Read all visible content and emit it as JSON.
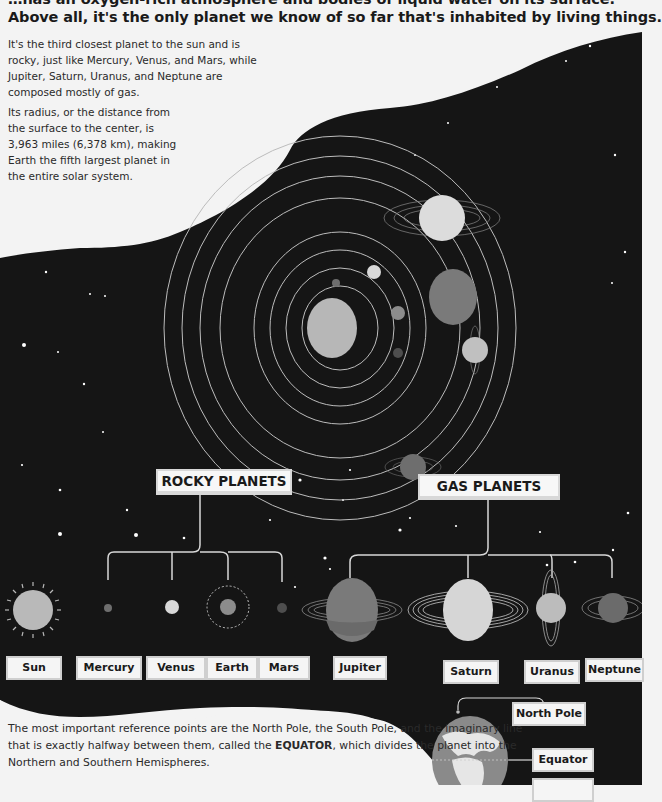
{
  "header": {
    "line1": "…has an oxygen-rich atmosphere and bodies of liquid water on its surface.",
    "line2": "Above all, it's the only planet we know of so far that's inhabited by living things."
  },
  "paragraphs": {
    "p1": "It's the third closest planet to the sun and is rocky, just like Mercury, Venus, and Mars, while Jupiter, Saturn, Uranus, and Neptune are composed mostly of gas.",
    "p2": "Its radius, or the distance from the surface to the center, is 3,963 miles (6,378 km), making Earth the fifth largest planet in the entire solar system.",
    "p3_pre": "The most important reference points are the North Pole, the South Pole, and the imaginary line that is exactly halfway between them, called the ",
    "p3_bold": "EQUATOR",
    "p3_post": ", which divides the planet into the Northern and Southern Hemispheres."
  },
  "categories": {
    "rocky": "ROCKY PLANETS",
    "gas": "GAS PLANETS"
  },
  "bodies": [
    {
      "name": "Sun",
      "type": "star"
    },
    {
      "name": "Mercury",
      "type": "rocky"
    },
    {
      "name": "Venus",
      "type": "rocky"
    },
    {
      "name": "Earth",
      "type": "rocky"
    },
    {
      "name": "Mars",
      "type": "rocky"
    },
    {
      "name": "Jupiter",
      "type": "gas"
    },
    {
      "name": "Saturn",
      "type": "gas"
    },
    {
      "name": "Uranus",
      "type": "gas"
    },
    {
      "name": "Neptune",
      "type": "gas"
    }
  ],
  "globe": {
    "north_pole": "North Pole",
    "equator": "Equator",
    "south_pole": "South Pole"
  },
  "colors": {
    "space": "#141414",
    "paper": "#f3f3f3",
    "orbit": "#bdbdbd",
    "sun": "#b9b9b9",
    "jupiter": "#7a7a7a",
    "saturn": "#d6d6d6",
    "uranus": "#bcbcbc",
    "neptune": "#6b6b6b"
  }
}
